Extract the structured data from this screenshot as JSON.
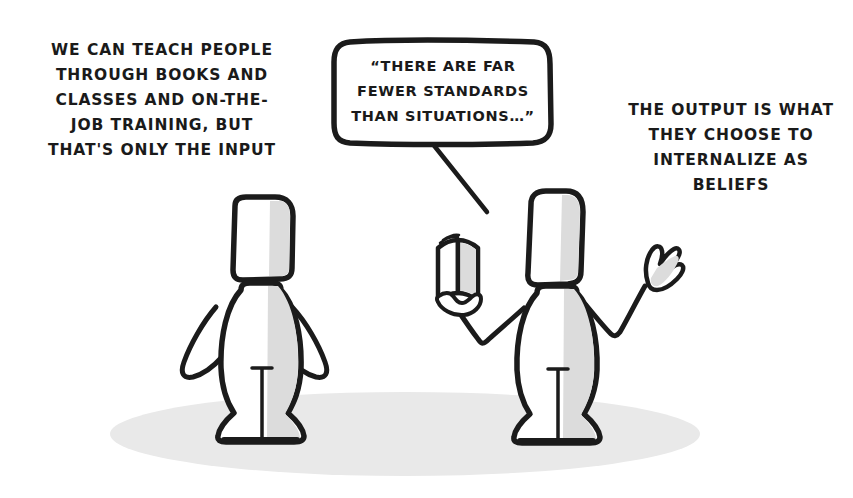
{
  "scene": {
    "title": "Input versus Output cartoon",
    "background_color": "#ffffff",
    "ink_color": "#1b1b1b",
    "shade_color": "#dcdcdc",
    "ground_shadow_color": "#e8e8e8",
    "width": 853,
    "height": 498
  },
  "captions": {
    "left": "WE CAN TEACH PEOPLE\nTHROUGH BOOKS AND\nCLASSES AND ON-THE-\nJOB TRAINING, BUT\nTHAT'S ONLY THE INPUT",
    "right": "THE OUTPUT IS WHAT\nTHEY CHOOSE TO\nINTERNALIZE AS\nBELIEFS"
  },
  "speech_bubble": {
    "text": "“THERE ARE FAR\nFEWER STANDARDS\nTHAN SITUATIONS…”",
    "tail_direction": "down-right",
    "speaker": "right-figure"
  },
  "figures": [
    {
      "name": "left-figure",
      "pose": "hands-on-hips",
      "description": "Stick-style character with rectangular head, arms akimbo, standing facing viewer"
    },
    {
      "name": "right-figure",
      "pose": "holding-open-book-and-raised-hand",
      "description": "Stick-style character with rectangular head, open book in one hand, other hand raised gesturing",
      "props": [
        "open-book",
        "raised-hand"
      ]
    }
  ]
}
